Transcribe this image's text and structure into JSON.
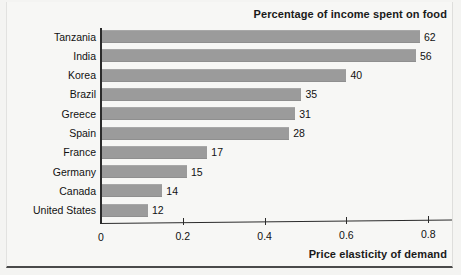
{
  "chart_data": {
    "type": "bar",
    "orientation": "horizontal",
    "title": "Percentage of income spent on food",
    "xlabel": "Price elasticity of demand",
    "ylabel": "",
    "xlim": [
      0,
      0.85
    ],
    "xticks": [
      "0",
      "0.2",
      "0.4",
      "0.6",
      "0.8"
    ],
    "xtick_values": [
      0,
      0.2,
      0.4,
      0.6,
      0.8
    ],
    "grid": false,
    "legend": "none",
    "bar_color": "#9b9b9b",
    "categories": [
      "Tanzania",
      "India",
      "Korea",
      "Brazil",
      "Greece",
      "Spain",
      "France",
      "Germany",
      "Canada",
      "United States"
    ],
    "values": [
      0.78,
      0.77,
      0.6,
      0.49,
      0.475,
      0.46,
      0.26,
      0.21,
      0.15,
      0.115
    ],
    "data_labels": [
      "62",
      "56",
      "40",
      "35",
      "31",
      "28",
      "17",
      "15",
      "14",
      "12"
    ],
    "data_label_meaning": "Percentage of income spent on food",
    "points": [
      {
        "category": "Tanzania",
        "elasticity": 0.78,
        "pct_income_on_food": 62
      },
      {
        "category": "India",
        "elasticity": 0.77,
        "pct_income_on_food": 56
      },
      {
        "category": "Korea",
        "elasticity": 0.6,
        "pct_income_on_food": 40
      },
      {
        "category": "Brazil",
        "elasticity": 0.49,
        "pct_income_on_food": 35
      },
      {
        "category": "Greece",
        "elasticity": 0.475,
        "pct_income_on_food": 31
      },
      {
        "category": "Spain",
        "elasticity": 0.46,
        "pct_income_on_food": 28
      },
      {
        "category": "France",
        "elasticity": 0.26,
        "pct_income_on_food": 17
      },
      {
        "category": "Germany",
        "elasticity": 0.21,
        "pct_income_on_food": 15
      },
      {
        "category": "Canada",
        "elasticity": 0.15,
        "pct_income_on_food": 14
      },
      {
        "category": "United States",
        "elasticity": 0.115,
        "pct_income_on_food": 12
      }
    ]
  }
}
